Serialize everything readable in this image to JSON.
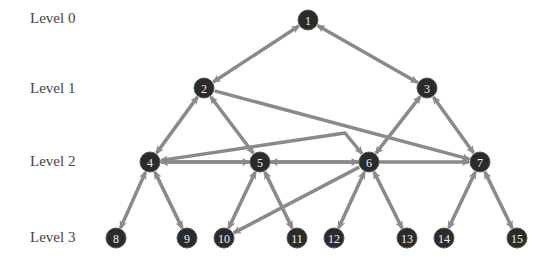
{
  "colors": {
    "node_fill": "#2b2b2b",
    "node_stroke": "#555555",
    "edge": "#8a8a8a",
    "label_text": "#444444",
    "node_text": "#f0f0f0"
  },
  "levels": [
    {
      "label": "Level 0",
      "y": 20
    },
    {
      "label": "Level 1",
      "y": 90
    },
    {
      "label": "Level 2",
      "y": 163
    },
    {
      "label": "Level 3",
      "y": 239
    }
  ],
  "nodes": [
    {
      "id": "1",
      "x": 308,
      "y": 20
    },
    {
      "id": "2",
      "x": 204,
      "y": 88
    },
    {
      "id": "3",
      "x": 427,
      "y": 88
    },
    {
      "id": "4",
      "x": 150,
      "y": 162
    },
    {
      "id": "5",
      "x": 260,
      "y": 162
    },
    {
      "id": "6",
      "x": 369,
      "y": 162
    },
    {
      "id": "7",
      "x": 480,
      "y": 162
    },
    {
      "id": "8",
      "x": 116,
      "y": 238
    },
    {
      "id": "9",
      "x": 187,
      "y": 238
    },
    {
      "id": "10",
      "x": 224,
      "y": 238
    },
    {
      "id": "11",
      "x": 297,
      "y": 238
    },
    {
      "id": "12",
      "x": 334,
      "y": 238
    },
    {
      "id": "13",
      "x": 407,
      "y": 238
    },
    {
      "id": "14",
      "x": 444,
      "y": 238
    },
    {
      "id": "15",
      "x": 517,
      "y": 238
    }
  ],
  "edges": [
    {
      "from": "1",
      "to": "2",
      "bidirectional": true
    },
    {
      "from": "1",
      "to": "3",
      "bidirectional": true
    },
    {
      "from": "2",
      "to": "4",
      "bidirectional": true
    },
    {
      "from": "2",
      "to": "5",
      "bidirectional": true
    },
    {
      "from": "2",
      "to": "7",
      "bidirectional": false
    },
    {
      "from": "3",
      "to": "6",
      "bidirectional": true
    },
    {
      "from": "3",
      "to": "7",
      "bidirectional": true
    },
    {
      "from": "4",
      "to": "5",
      "bidirectional": true
    },
    {
      "from": "4",
      "to": "6",
      "bidirectional": true,
      "via": [
        345,
        133
      ]
    },
    {
      "from": "5",
      "to": "6",
      "bidirectional": true
    },
    {
      "from": "4",
      "to": "7",
      "bidirectional": true
    },
    {
      "from": "6",
      "to": "10",
      "bidirectional": false
    },
    {
      "from": "4",
      "to": "8",
      "bidirectional": true
    },
    {
      "from": "4",
      "to": "9",
      "bidirectional": true
    },
    {
      "from": "5",
      "to": "10",
      "bidirectional": true
    },
    {
      "from": "5",
      "to": "11",
      "bidirectional": true
    },
    {
      "from": "6",
      "to": "12",
      "bidirectional": true
    },
    {
      "from": "6",
      "to": "13",
      "bidirectional": true
    },
    {
      "from": "7",
      "to": "14",
      "bidirectional": true
    },
    {
      "from": "7",
      "to": "15",
      "bidirectional": true
    }
  ]
}
